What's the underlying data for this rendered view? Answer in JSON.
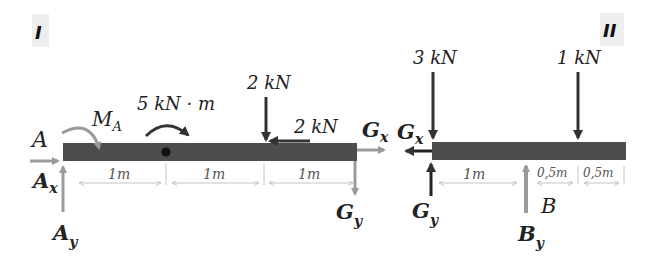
{
  "diagram": {
    "colors": {
      "beam": "#4d4d4d",
      "reaction": "#9a9a9a",
      "applied": "#333333",
      "dimension": "#b5b5b5",
      "tag_bg": "#eeeeee"
    },
    "panel_I": {
      "tag": "I",
      "point_A": "A",
      "moment_A": "M",
      "moment_A_sub": "A",
      "applied_moment": "5 kN · m",
      "force_down": "2 kN",
      "force_horizontal": "2 kN",
      "Ax": "A",
      "Ax_sub": "x",
      "Ay": "A",
      "Ay_sub": "y",
      "Gx": "G",
      "Gx_sub": "x",
      "Gy": "G",
      "Gy_sub": "y",
      "dimensions": [
        "1m",
        "1m",
        "1m"
      ]
    },
    "panel_II": {
      "tag": "II",
      "force_left": "3 kN",
      "force_right": "1 kN",
      "Gx": "G",
      "Gx_sub": "x",
      "Gy": "G",
      "Gy_sub": "y",
      "point_B": "B",
      "By": "B",
      "By_sub": "y",
      "dimensions": [
        "1m",
        "0,5m",
        "0,5m"
      ]
    }
  }
}
